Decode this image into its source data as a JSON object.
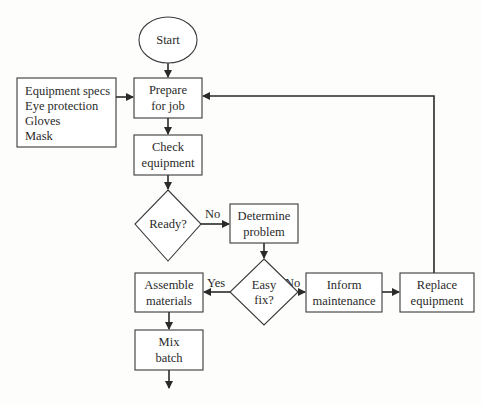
{
  "diagram": {
    "type": "flowchart",
    "nodes": {
      "start": {
        "shape": "ellipse",
        "lines": [
          "Start"
        ]
      },
      "prepare": {
        "shape": "rect",
        "lines": [
          "Prepare",
          "for job"
        ]
      },
      "inputs": {
        "shape": "rect",
        "lines": [
          "Equipment specs",
          "Eye protection",
          "Gloves",
          "Mask"
        ]
      },
      "check": {
        "shape": "rect",
        "lines": [
          "Check",
          "equipment"
        ]
      },
      "ready": {
        "shape": "diamond",
        "lines": [
          "Ready?"
        ]
      },
      "determine": {
        "shape": "rect",
        "lines": [
          "Determine",
          "problem"
        ]
      },
      "easyfix": {
        "shape": "diamond",
        "lines": [
          "Easy",
          "fix?"
        ]
      },
      "assemble": {
        "shape": "rect",
        "lines": [
          "Assemble",
          "materials"
        ]
      },
      "mix": {
        "shape": "rect",
        "lines": [
          "Mix",
          "batch"
        ]
      },
      "inform": {
        "shape": "rect",
        "lines": [
          "Inform",
          "maintenance"
        ]
      },
      "replace": {
        "shape": "rect",
        "lines": [
          "Replace",
          "equipment"
        ]
      }
    },
    "edges": [
      {
        "from": "start",
        "to": "prepare",
        "label": ""
      },
      {
        "from": "inputs",
        "to": "prepare",
        "label": ""
      },
      {
        "from": "prepare",
        "to": "check",
        "label": ""
      },
      {
        "from": "check",
        "to": "ready",
        "label": ""
      },
      {
        "from": "ready",
        "to": "determine",
        "label": "No"
      },
      {
        "from": "determine",
        "to": "easyfix",
        "label": ""
      },
      {
        "from": "easyfix",
        "to": "assemble",
        "label": "Yes"
      },
      {
        "from": "easyfix",
        "to": "inform",
        "label": "No"
      },
      {
        "from": "inform",
        "to": "replace",
        "label": ""
      },
      {
        "from": "replace",
        "to": "prepare",
        "label": ""
      },
      {
        "from": "assemble",
        "to": "mix",
        "label": ""
      },
      {
        "from": "mix",
        "to": "(continues)",
        "label": ""
      }
    ],
    "edge_labels": {
      "ready_no": "No",
      "easyfix_yes": "Yes",
      "easyfix_no": "No"
    }
  }
}
